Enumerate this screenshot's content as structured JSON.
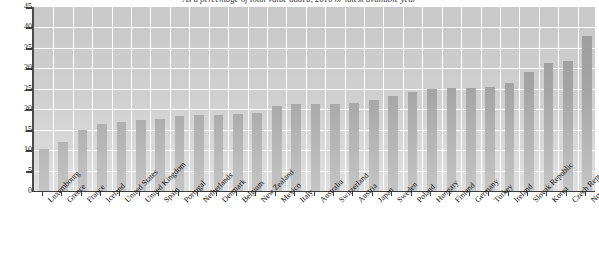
{
  "chart_data": {
    "type": "bar",
    "title": "As a percentage of total value added, 2010 or latest available year",
    "xlabel": "",
    "ylabel": "",
    "ylim": [
      0,
      45
    ],
    "ytick_step": 5,
    "yticks": [
      45,
      40,
      35,
      30,
      25,
      20,
      15,
      10,
      5,
      0
    ],
    "grid": true,
    "legend": "none",
    "bar_color": "#9a9a9a",
    "plot_background": "#c9c9c9",
    "gridline_color": "#ffffff",
    "categories": [
      "Luxembourg",
      "Greece",
      "France",
      "Iceland",
      "United States",
      "United Kingdom",
      "Spain",
      "Portugal",
      "Netherlands",
      "Denmark",
      "Belgium",
      "New Zealand",
      "Mexico",
      "Italy",
      "Australia",
      "Switzerland",
      "Austria",
      "Japan",
      "Sweden",
      "Poland",
      "Hungary",
      "Finland",
      "Germany",
      "Turkey",
      "Ireland",
      "Slovak Republic",
      "Korea",
      "Czech Republic",
      "Norway"
    ],
    "values": [
      10.2,
      12.0,
      15.0,
      16.3,
      17.0,
      17.3,
      17.6,
      18.3,
      18.6,
      18.6,
      18.8,
      19.0,
      20.8,
      21.2,
      21.3,
      21.4,
      21.5,
      22.3,
      23.3,
      24.3,
      25.0,
      25.2,
      25.3,
      25.5,
      26.5,
      29.0,
      31.3,
      31.8,
      37.8
    ]
  }
}
